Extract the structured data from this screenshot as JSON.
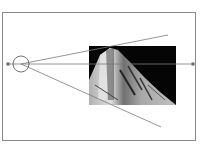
{
  "diagram": {
    "colors": {
      "frame": "#8a8a8a",
      "line": "#7a7a7a",
      "image_bg": "#050505",
      "image_light": "#c8c8c8"
    },
    "eye": {
      "cx": 21,
      "cy": 64,
      "r": 8
    },
    "axis": {
      "x1": 8,
      "y1": 64,
      "x2": 193,
      "y2": 64
    },
    "rays": [
      {
        "name": "upper-ray",
        "x1": 21,
        "y1": 64,
        "x2": 168,
        "y2": 35
      },
      {
        "name": "lower-ray",
        "x1": 21,
        "y1": 64,
        "x2": 161,
        "y2": 127
      }
    ],
    "image_plane": {
      "x": 89,
      "y": 46,
      "width": 87,
      "height": 59
    }
  }
}
